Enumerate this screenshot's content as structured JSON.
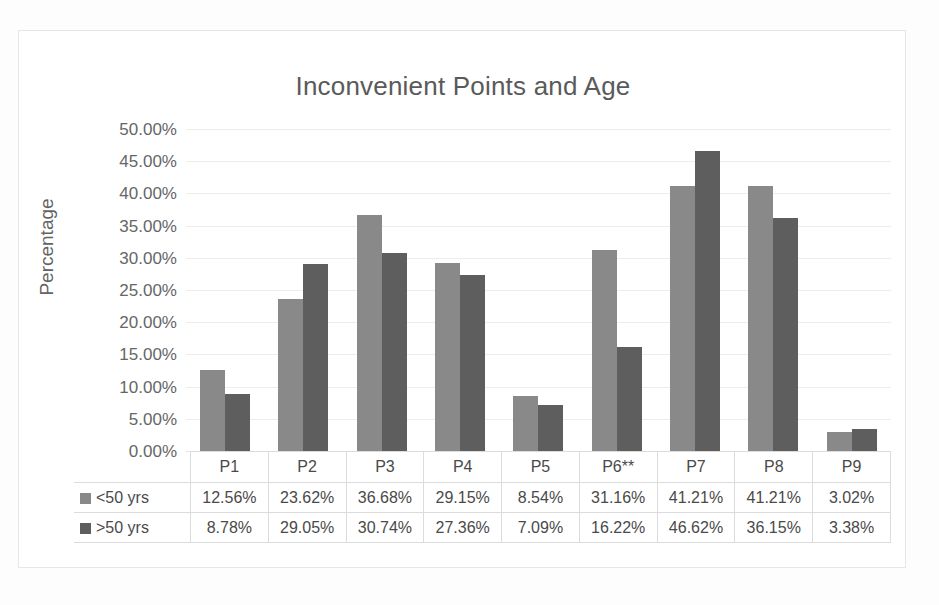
{
  "chart_data": {
    "type": "bar",
    "title": "Inconvenient Points and Age",
    "xlabel": "",
    "ylabel": "Percentage",
    "ylim": [
      0,
      50
    ],
    "ytick_labels": [
      "50.00%",
      "45.00%",
      "40.00%",
      "35.00%",
      "30.00%",
      "25.00%",
      "20.00%",
      "15.00%",
      "10.00%",
      "5.00%",
      "0.00%"
    ],
    "ytick_values": [
      50,
      45,
      40,
      35,
      30,
      25,
      20,
      15,
      10,
      5,
      0
    ],
    "grid": true,
    "legend_position": "data-table",
    "categories": [
      "P1",
      "P2",
      "P3",
      "P4",
      "P5",
      "P6**",
      "P7",
      "P8",
      "P9"
    ],
    "series": [
      {
        "name": "<50 yrs",
        "color": "#898989",
        "values": [
          12.56,
          23.62,
          36.68,
          29.15,
          8.54,
          31.16,
          41.21,
          41.21,
          3.02
        ],
        "labels": [
          "12.56%",
          "23.62%",
          "36.68%",
          "29.15%",
          "8.54%",
          "31.16%",
          "41.21%",
          "41.21%",
          "3.02%"
        ]
      },
      {
        "name": ">50 yrs",
        "color": "#5e5e5e",
        "values": [
          8.78,
          29.05,
          30.74,
          27.36,
          7.09,
          16.22,
          46.62,
          36.15,
          3.38
        ],
        "labels": [
          "8.78%",
          "29.05%",
          "30.74%",
          "27.36%",
          "7.09%",
          "16.22%",
          "46.62%",
          "36.15%",
          "3.38%"
        ]
      }
    ]
  },
  "colors": {
    "series_1": "#898989",
    "series_2": "#5e5e5e",
    "gridline": "#ededed",
    "text": "#4a4a4a",
    "title_text": "#5a5a5a",
    "frame_border": "#e6e6e6",
    "background": "#ffffff"
  }
}
